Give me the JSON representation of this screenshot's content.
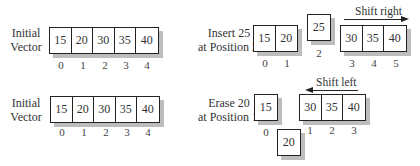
{
  "panels": {
    "initial_top": {
      "label_line1": "Initial",
      "label_line2": "Vector",
      "cells": [
        "15",
        "20",
        "30",
        "35",
        "40"
      ],
      "indices": [
        "0",
        "1",
        "2",
        "3",
        "4"
      ]
    },
    "insert": {
      "label_line1": "Insert 25",
      "label_line2": "at Position 2",
      "left_cells": [
        "15",
        "20"
      ],
      "left_indices": [
        "0",
        "1"
      ],
      "inserted_cell": "25",
      "inserted_index": "2",
      "right_cells": [
        "30",
        "35",
        "40"
      ],
      "right_indices": [
        "3",
        "4",
        "5"
      ],
      "arrow_caption": "Shift right"
    },
    "initial_bottom": {
      "label_line1": "Initial",
      "label_line2": "Vector",
      "cells": [
        "15",
        "20",
        "30",
        "35",
        "40"
      ],
      "indices": [
        "0",
        "1",
        "2",
        "3",
        "4"
      ]
    },
    "erase": {
      "label_line1": "Erase 20",
      "label_line2": "at Position 1",
      "left_cell": "15",
      "left_index": "0",
      "removed_cell": "20",
      "right_cells": [
        "30",
        "35",
        "40"
      ],
      "right_indices": [
        "1",
        "2",
        "3"
      ],
      "arrow_caption": "Shift left"
    }
  }
}
